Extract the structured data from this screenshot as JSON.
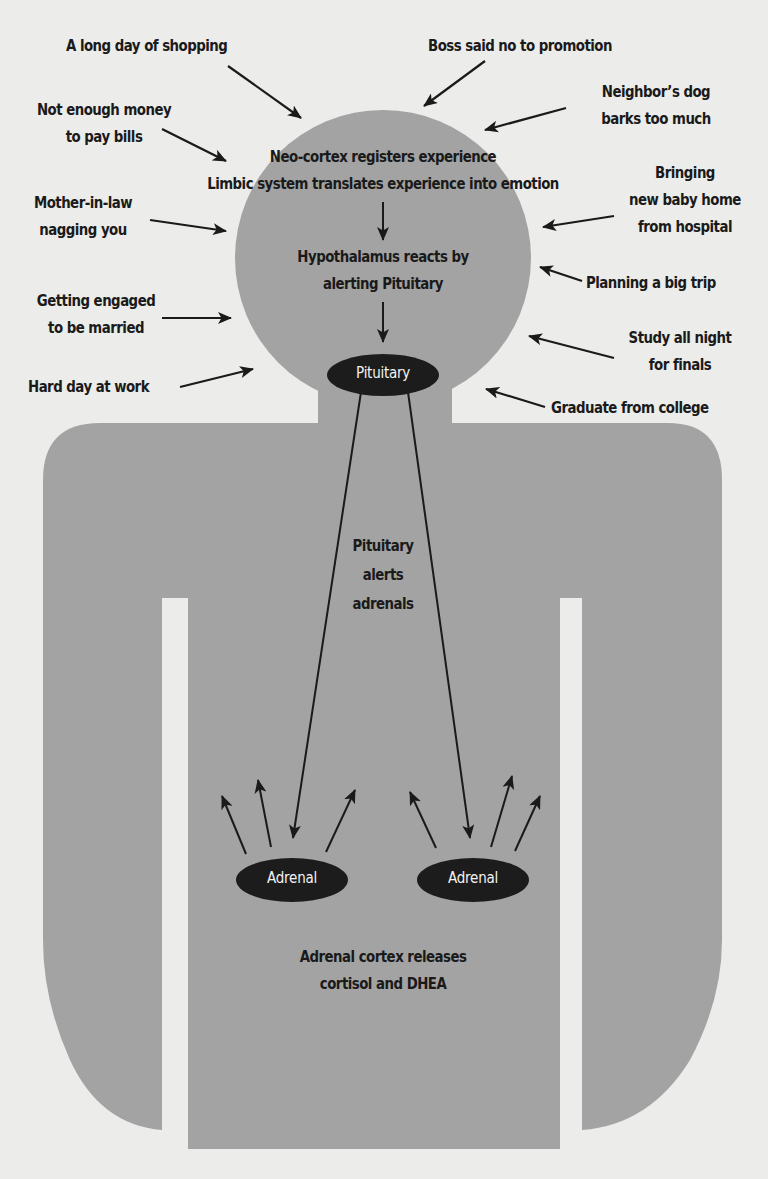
{
  "colors": {
    "background": "#ececea",
    "body_fill": "#a3a3a3",
    "ink": "#1a1a1a",
    "gland_fill": "#1c1c1c",
    "gland_text": "#f2f2f2"
  },
  "stressors": {
    "shopping": {
      "lines": [
        "A long day of shopping"
      ]
    },
    "boss": {
      "lines": [
        "Boss said no to promotion"
      ]
    },
    "money": {
      "lines": [
        "Not enough money",
        "to pay bills"
      ]
    },
    "dog": {
      "lines": [
        "Neighbor’s dog",
        "barks too much"
      ]
    },
    "mother_in_law": {
      "lines": [
        "Mother-in-law",
        "nagging you"
      ]
    },
    "baby": {
      "lines": [
        "Bringing",
        "new baby home",
        "from hospital"
      ]
    },
    "trip": {
      "lines": [
        "Planning a big trip"
      ]
    },
    "engaged": {
      "lines": [
        "Getting engaged",
        "to be married"
      ]
    },
    "study": {
      "lines": [
        "Study all night",
        "for finals"
      ]
    },
    "work": {
      "lines": [
        "Hard day at work"
      ]
    },
    "graduate": {
      "lines": [
        "Graduate from college"
      ]
    }
  },
  "process": {
    "neocortex": "Neo-cortex registers experience",
    "limbic": "Limbic system translates experience into emotion",
    "hypothalamus": [
      "Hypothalamus reacts by",
      "alerting Pituitary"
    ],
    "pituitary_alert": [
      "Pituitary",
      "alerts",
      "adrenals"
    ],
    "adrenal_release": [
      "Adrenal cortex releases",
      "cortisol and DHEA"
    ]
  },
  "glands": {
    "pituitary": "Pituitary",
    "adrenal_left": "Adrenal",
    "adrenal_right": "Adrenal"
  }
}
